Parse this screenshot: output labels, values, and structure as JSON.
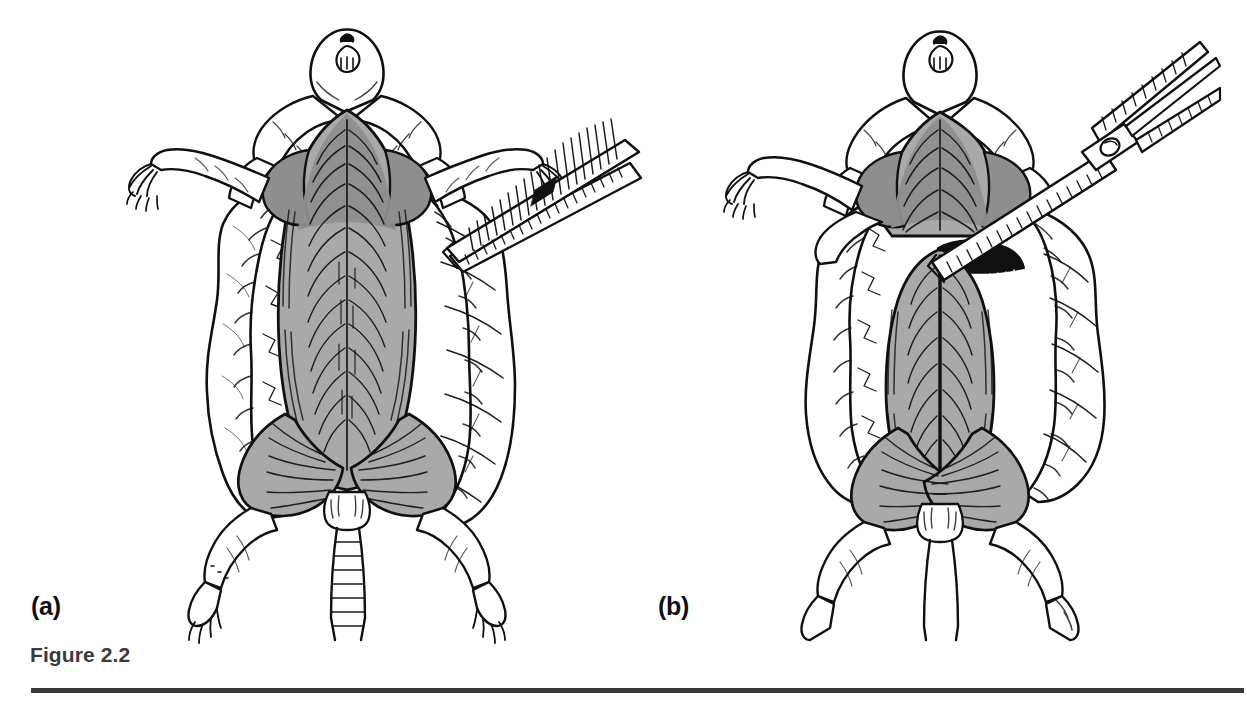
{
  "figure": {
    "caption": "Figure 2.2",
    "panels": [
      {
        "id": "a",
        "label": "(a)",
        "subject": "dissected rodent, ventral view, skin reflected",
        "instrument": "forceps",
        "description": "Rodent pinned ventral side up with the skin cut and reflected laterally to expose the abdominal musculature; serrated forceps grip and tent the right flank of skin."
      },
      {
        "id": "b",
        "label": "(b)",
        "subject": "dissected rodent, ventral view, midline incision",
        "instrument": "scissors",
        "description": "Blunt-tipped surgical scissors cut the abdominal wall along the ventral midline, opening the body cavity from the xiphoid toward the pelvis."
      }
    ]
  },
  "style": {
    "ink": "#101010",
    "muscle_fill": "#a9a9a9",
    "muscle_fill_dark": "#8e8e8e",
    "skin_fill": "#ffffff",
    "cavity_fill": "#101010",
    "caption_color": "#3b3b3b",
    "rule_color": "#3a3a3a",
    "background": "#ffffff"
  },
  "icons": {
    "forceps": "forceps-icon",
    "scissors": "scissors-icon",
    "rodent": "rodent-icon"
  }
}
